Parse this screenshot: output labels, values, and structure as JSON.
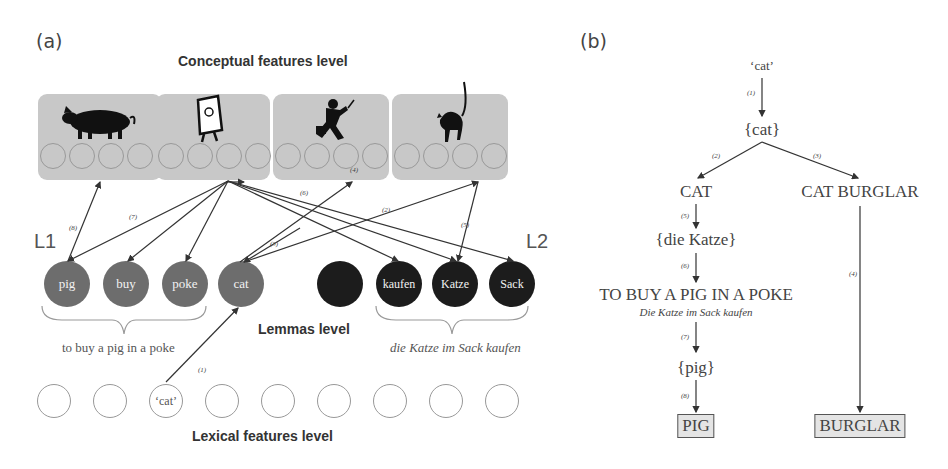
{
  "panel_a": {
    "label": "(a)",
    "conceptual_title": "Conceptual features level",
    "concepts": [
      {
        "name": "pig",
        "icon": "pig-icon"
      },
      {
        "name": "bag",
        "icon": "bag-icon"
      },
      {
        "name": "burglar",
        "icon": "burglar-icon"
      },
      {
        "name": "cat",
        "icon": "cat-icon"
      }
    ],
    "l1_label": "L1",
    "l2_label": "L2",
    "lemmas_title": "Lemmas level",
    "lemmas_l1": [
      "pig",
      "buy",
      "poke",
      "cat"
    ],
    "lemmas_l2": [
      "",
      "kaufen",
      "Katze",
      "Sack"
    ],
    "l1_idiom": "to buy a pig in a poke",
    "l2_idiom": "die Katze im Sack kaufen",
    "lexical_title": "Lexical features level",
    "lexical_nodes": [
      "",
      "",
      "‘cat’",
      "",
      "",
      "",
      "",
      "",
      ""
    ],
    "arrow_numbers": [
      "(1)",
      "(2)",
      "(3)",
      "(4)",
      "(5)",
      "(6)",
      "(7)",
      "(8)"
    ]
  },
  "panel_b": {
    "label": "(b)",
    "nodes": {
      "word": "‘cat’",
      "lemma_cat": "{cat}",
      "concept_cat": "CAT",
      "concept_burglar": "CAT BURGLAR",
      "lemma_katze": "{die Katze}",
      "idiom": "TO BUY A PIG IN A POKE",
      "idiom_german": "Die Katze im Sack kaufen",
      "lemma_pig": "{pig}",
      "result_pig": "PIG",
      "result_burglar": "BURGLAR"
    },
    "edges": [
      "(1)",
      "(2)",
      "(3)",
      "(4)",
      "(5)",
      "(6)",
      "(7)",
      "(8)"
    ]
  }
}
